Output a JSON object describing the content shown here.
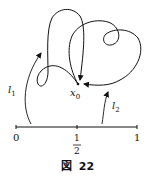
{
  "figure": {
    "caption_prefix": "図",
    "caption_number": "22",
    "point_label": "x",
    "point_sub": "0",
    "path_labels": [
      {
        "name": "l",
        "sub": "1"
      },
      {
        "name": "l",
        "sub": "2"
      }
    ],
    "axis": {
      "ticks": [
        {
          "label": "0"
        },
        {
          "numerator": "1",
          "denominator": "2"
        },
        {
          "label": "1"
        }
      ]
    },
    "colors": {
      "ink": "#111111",
      "background": "#ffffff"
    }
  }
}
